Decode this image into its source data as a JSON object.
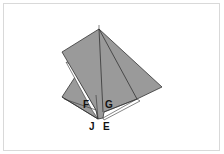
{
  "diagram": {
    "type": "origami-fold-step",
    "colors": {
      "paper_fill": "#9a9a9a",
      "paper_light": "#ffffff",
      "line": "#333333",
      "frame": "#d9d9d9"
    },
    "labels": {
      "F": "F",
      "G": "G",
      "J": "J",
      "E": "E"
    }
  }
}
